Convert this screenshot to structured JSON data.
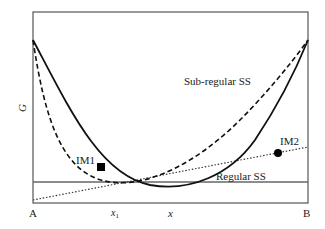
{
  "diagram": {
    "y_axis_label": "G",
    "x_axis_label": "x",
    "x_left_endpoint": "A",
    "x_right_endpoint": "B",
    "x_marker_label": "x",
    "x_marker_subscript": "1",
    "curves": {
      "subregular": {
        "label": "Sub-regular SS",
        "style": "dashed"
      },
      "regular": {
        "label": "Regular SS",
        "style": "solid"
      }
    },
    "reference_line": {
      "style": "solid-horizontal"
    },
    "tangent_line": {
      "style": "dotted"
    },
    "points": [
      {
        "label": "IM1",
        "marker": "square"
      },
      {
        "label": "IM2",
        "marker": "circle"
      }
    ],
    "colors": {
      "frame": "#555555",
      "curve": "#111111",
      "reference_line": "#666666"
    }
  }
}
